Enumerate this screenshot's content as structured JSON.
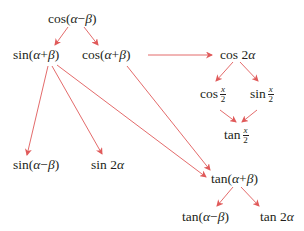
{
  "diagram": {
    "arrow_color": "#e05a5a",
    "text_color": "#231f20",
    "nodes": {
      "cos_minus": {
        "fn": "cos",
        "open": "(",
        "a": "α",
        "op": "−",
        "b": "β",
        "close": ")"
      },
      "sin_plus": {
        "fn": "sin",
        "open": "(",
        "a": "α",
        "op": "+",
        "b": "β",
        "close": ")"
      },
      "cos_plus": {
        "fn": "cos",
        "open": "(",
        "a": "α",
        "op": "+",
        "b": "β",
        "close": ")"
      },
      "cos_double": {
        "fn": "cos",
        "coef": "2",
        "var": "α"
      },
      "cos_half": {
        "fn": "cos",
        "num": "x",
        "den": "2"
      },
      "sin_half": {
        "fn": "sin",
        "num": "x",
        "den": "2"
      },
      "tan_half": {
        "fn": "tan",
        "num": "x",
        "den": "2"
      },
      "sin_minus": {
        "fn": "sin",
        "open": "(",
        "a": "α",
        "op": "−",
        "b": "β",
        "close": ")"
      },
      "sin_double": {
        "fn": "sin",
        "coef": "2",
        "var": "α"
      },
      "tan_plus": {
        "fn": "tan",
        "open": "(",
        "a": "α",
        "op": "+",
        "b": "β",
        "close": ")"
      },
      "tan_minus": {
        "fn": "tan",
        "open": "(",
        "a": "α",
        "op": "−",
        "b": "β",
        "close": ")"
      },
      "tan_double": {
        "fn": "tan",
        "coef": "2",
        "var": "α"
      }
    },
    "edges": [
      {
        "from": "cos(α−β)",
        "to": "sin(α+β)"
      },
      {
        "from": "cos(α−β)",
        "to": "cos(α+β)"
      },
      {
        "from": "cos(α+β)",
        "to": "cos 2α"
      },
      {
        "from": "cos(α+β)",
        "to": "tan(α+β)"
      },
      {
        "from": "sin(α+β)",
        "to": "sin(α−β)"
      },
      {
        "from": "sin(α+β)",
        "to": "sin 2α"
      },
      {
        "from": "sin(α+β)",
        "to": "tan(α+β)"
      },
      {
        "from": "cos 2α",
        "to": "cos x/2"
      },
      {
        "from": "cos 2α",
        "to": "sin x/2"
      },
      {
        "from": "cos x/2",
        "to": "tan x/2"
      },
      {
        "from": "sin x/2",
        "to": "tan x/2"
      },
      {
        "from": "tan(α+β)",
        "to": "tan(α−β)"
      },
      {
        "from": "tan(α+β)",
        "to": "tan 2α"
      }
    ]
  }
}
